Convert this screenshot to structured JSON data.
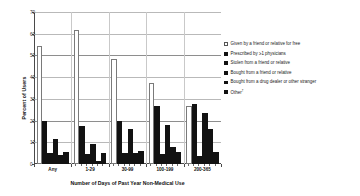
{
  "chart_data": {
    "type": "bar",
    "title": "",
    "xlabel": "Number of Days of Past Year Non-Medical Use",
    "ylabel": "Percent of Users",
    "ylim": [
      0,
      70
    ],
    "yticks": [
      0,
      10,
      20,
      30,
      40,
      50,
      60,
      70
    ],
    "ytick_labels": [
      "0",
      "10",
      "20",
      "30",
      "40",
      "50",
      "60",
      "70"
    ],
    "grid": true,
    "legend_position": "right",
    "categories": [
      "Any",
      "1-29",
      "30-99",
      "100-199",
      "200-365"
    ],
    "series": [
      {
        "name": "Given by a friend or relative for free",
        "style": "open",
        "color": "#ffffff",
        "values": [
          54.5,
          61.5,
          48.5,
          37.5,
          26.5
        ]
      },
      {
        "name": "Prescribed by ≥1 physicians",
        "style": "filled",
        "color": "#121212",
        "values": [
          20.0,
          17.5,
          20.0,
          26.5,
          27.5
        ]
      },
      {
        "name": "Stolen from a friend or relative",
        "style": "filled",
        "color": "#121212",
        "values": [
          5.0,
          4.5,
          5.0,
          4.5,
          3.5
        ]
      },
      {
        "name": "Bought from a friend or relative",
        "style": "filled",
        "color": "#121212",
        "values": [
          11.5,
          9.0,
          16.0,
          18.0,
          23.5
        ]
      },
      {
        "name": "Bought from a drug dealer or other stranger",
        "style": "filled",
        "color": "#121212",
        "values": [
          4.0,
          1.5,
          5.0,
          8.0,
          16.0
        ]
      },
      {
        "name": "Other†",
        "style": "filled",
        "color": "#121212",
        "values": [
          5.5,
          5.0,
          6.0,
          5.5,
          5.5
        ]
      }
    ]
  },
  "axes": {
    "y_title": "Percent of Users",
    "x_title": "Number of Days of Past Year Non-Medical Use",
    "y_labels": [
      "70",
      "60",
      "50",
      "40",
      "30",
      "20",
      "10",
      "0"
    ],
    "x_labels": [
      "Any",
      "1-29",
      "30-99",
      "100-199",
      "200-365"
    ]
  },
  "legend": {
    "items": [
      {
        "label": "Given by a friend or relative for free",
        "style": "open"
      },
      {
        "label": "Prescribed by ≥1 physicians",
        "style": "filled"
      },
      {
        "label": "Stolen from a friend or relative",
        "style": "filled"
      },
      {
        "label": "Bought from a friend or relative",
        "style": "filled"
      },
      {
        "label": "Bought from a drug dealer or other stranger",
        "style": "filled"
      },
      {
        "label": "Other†",
        "style": "filled"
      }
    ]
  },
  "colors": {
    "bar_filled": "#121212",
    "bar_open_border": "#7a7a7a",
    "grid": "#b9b9b9",
    "axis": "#4a4a4a",
    "background": "#ffffff"
  }
}
